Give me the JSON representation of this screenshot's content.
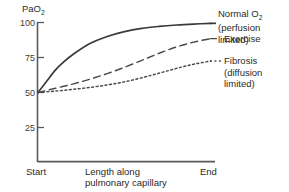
{
  "chart_data": {
    "type": "line",
    "title": "",
    "subtitle": "",
    "ylabel": "PaO2",
    "ylabel_base": "PaO",
    "ylabel_sub": "2",
    "xlabel_line1": "Length along",
    "xlabel_line2": "pulmonary capillary",
    "x_start_label": "Start",
    "x_end_label": "End",
    "ylim": [
      0,
      100
    ],
    "xlim": [
      0,
      1
    ],
    "ytick_values": [
      100,
      75,
      50,
      25
    ],
    "ytick_labels": [
      "100",
      "75",
      "50",
      "25"
    ],
    "grid": false,
    "legend_position": "right-inline",
    "series": [
      {
        "name": "Normal O2",
        "label_line1": "Normal O",
        "label_sub": "2",
        "label_line2": "(perfusion limited)",
        "style": "solid",
        "color": "#3a3a3a",
        "x": [
          0.0,
          0.05,
          0.1,
          0.15,
          0.2,
          0.3,
          0.4,
          0.5,
          0.6,
          0.7,
          0.8,
          0.9,
          1.0
        ],
        "values": [
          50,
          58,
          66,
          72,
          77,
          85,
          90,
          93.5,
          95.8,
          97.2,
          98.2,
          98.9,
          99.4
        ]
      },
      {
        "name": "Exercise",
        "label_line1": "Exercise",
        "label_sub": "",
        "label_line2": "",
        "style": "dashed",
        "color": "#4a4a4a",
        "x": [
          0.0,
          0.1,
          0.2,
          0.3,
          0.4,
          0.5,
          0.6,
          0.7,
          0.8,
          0.9,
          1.0
        ],
        "values": [
          50,
          53,
          56,
          59.5,
          63.5,
          68,
          73,
          78,
          82.5,
          86,
          88.5
        ]
      },
      {
        "name": "Fibrosis",
        "label_line1": "Fibrosis",
        "label_sub": "",
        "label_line2": "(diffusion limited)",
        "style": "dotted",
        "color": "#4a4a4a",
        "x": [
          0.0,
          0.1,
          0.2,
          0.3,
          0.4,
          0.5,
          0.6,
          0.7,
          0.8,
          0.9,
          1.0
        ],
        "values": [
          50,
          51,
          52.2,
          53.6,
          55.4,
          57.6,
          60.5,
          63.8,
          67.2,
          70.2,
          72.5
        ]
      }
    ]
  },
  "axes": {
    "axis_color": "#555555",
    "y_tick_marks": 4
  }
}
